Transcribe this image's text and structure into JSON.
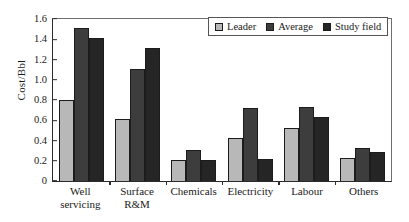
{
  "chart_data": {
    "type": "bar",
    "title": "",
    "xlabel": "",
    "ylabel": "Cost/Bbl",
    "categories": [
      "Well servicing",
      "Surface R&M",
      "Chemicals",
      "Electricity",
      "Labour",
      "Others"
    ],
    "category_lines": [
      [
        "Well",
        "servicing"
      ],
      [
        "Surface",
        "R&M"
      ],
      [
        "Chemicals"
      ],
      [
        "Electricity"
      ],
      [
        "Labour"
      ],
      [
        "Others"
      ]
    ],
    "series": [
      {
        "name": "Leader",
        "color": "#b8b8b8",
        "values": [
          0.8,
          0.61,
          0.21,
          0.42,
          0.52,
          0.23
        ]
      },
      {
        "name": "Average",
        "color": "#3d3d3d",
        "values": [
          1.51,
          1.11,
          0.31,
          0.72,
          0.73,
          0.33
        ]
      },
      {
        "name": "Study field",
        "color": "#252525",
        "values": [
          1.41,
          1.31,
          0.21,
          0.22,
          0.63,
          0.29
        ]
      }
    ],
    "ylim": [
      0,
      1.6
    ],
    "ytick_values": [
      0,
      0.2,
      0.4,
      0.6,
      0.8,
      1.0,
      1.2,
      1.4,
      1.6
    ],
    "ytick_labels": [
      "0",
      "0.2",
      "0.4",
      "0.6",
      "0.8",
      "1.0",
      "1.2",
      "1.4",
      "1.6"
    ],
    "grid": false,
    "legend_position": "top-right"
  }
}
